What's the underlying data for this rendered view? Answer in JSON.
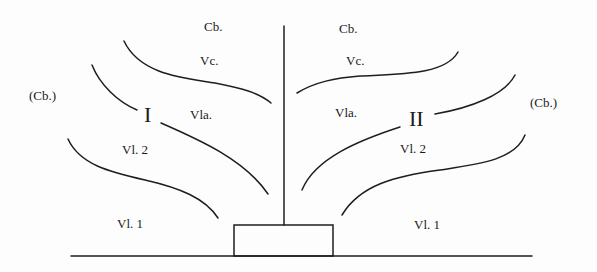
{
  "diagram": {
    "colors": {
      "ink": "#1e1e1e",
      "background": "#fdfdfd"
    },
    "labels": {
      "cb_left_top": "Cb.",
      "cb_right_top": "Cb.",
      "vc_left": "Vc.",
      "vc_right": "Vc.",
      "cb_left_outer": "(Cb.)",
      "cb_right_outer": "(Cb.)",
      "roman_left": "I",
      "roman_right": "II",
      "vla_left": "Vla.",
      "vla_right": "Vla.",
      "vl2_left": "Vl. 2",
      "vl2_right": "Vl. 2",
      "vl1_left": "Vl. 1",
      "vl1_right": "Vl. 1"
    }
  }
}
